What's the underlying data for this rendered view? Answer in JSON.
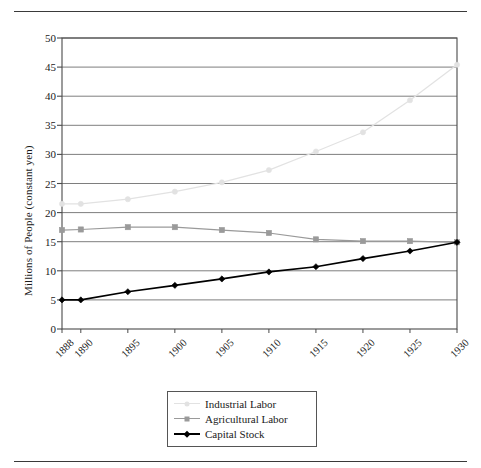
{
  "figure": {
    "top_rule": true,
    "bottom_rule": true,
    "clipped_caption": "··"
  },
  "chart_data": {
    "type": "line",
    "title": "",
    "subtitle": "",
    "xlabel": "",
    "ylabel": "Millions of People (constant yen)",
    "x": [
      1888,
      1890,
      1895,
      1900,
      1905,
      1910,
      1915,
      1920,
      1925,
      1930
    ],
    "categories": [
      "1888",
      "1890",
      "1895",
      "1900",
      "1905",
      "1910",
      "1915",
      "1920",
      "1925",
      "1930"
    ],
    "xlim": [
      1888,
      1930
    ],
    "ylim": [
      0,
      50
    ],
    "yticks": [
      0,
      5,
      10,
      15,
      20,
      25,
      30,
      35,
      40,
      45,
      50
    ],
    "ytick_labels": [
      "0",
      "5",
      "10",
      "15",
      "20",
      "25",
      "30",
      "35",
      "40",
      "45",
      "50"
    ],
    "grid": "horizontal",
    "legend_position": "below-axes-center",
    "series": [
      {
        "name": "Industrial Labor",
        "color": "#e2e2e2",
        "marker": "circle",
        "values": [
          21.5,
          21.5,
          22.3,
          23.6,
          25.2,
          27.3,
          30.5,
          33.8,
          39.3,
          45.4
        ]
      },
      {
        "name": "Agricultural Labor",
        "color": "#9a9a9a",
        "marker": "square",
        "values": [
          17.0,
          17.1,
          17.5,
          17.5,
          17.0,
          16.5,
          15.4,
          15.1,
          15.1,
          14.9
        ]
      },
      {
        "name": "Capital Stock",
        "color": "#000000",
        "marker": "diamond",
        "values": [
          5.0,
          5.0,
          6.4,
          7.5,
          8.6,
          9.8,
          10.7,
          12.1,
          13.4,
          14.9
        ]
      }
    ]
  },
  "legend": {
    "entries": [
      {
        "label": "Industrial Labor"
      },
      {
        "label": "Agricultural Labor"
      },
      {
        "label": "Capital Stock"
      }
    ]
  },
  "axes": {
    "frame_color": "#4a4a4a",
    "grid_color": "#6f6f6f"
  }
}
